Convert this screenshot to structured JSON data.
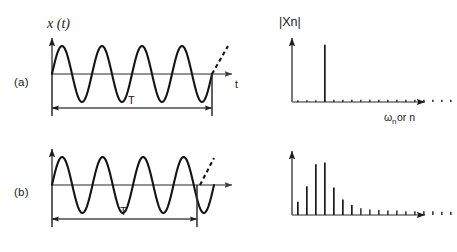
{
  "figure": {
    "title": "",
    "background_color": "#ffffff",
    "ink_color": "#141414",
    "axis_color": "#6f6f6f",
    "width": 457,
    "height": 252
  },
  "labels": {
    "panel_a": "(a)",
    "panel_b": "(b)",
    "time_axis_signal": "x (t)",
    "time_axis_name": "t",
    "period_marker": "T",
    "spectrum_axis_magnitude": "|Xn|",
    "spectrum_axis_freq_omega": "ω",
    "spectrum_axis_freq_sub": "n",
    "spectrum_axis_freq_tail": "or n"
  },
  "chart_data": [
    {
      "id": "panel-a-time-domain",
      "type": "line",
      "panel": "(a)",
      "title": "",
      "xlabel": "t",
      "ylabel": "x (t)",
      "description": "Pure sinusoid, four complete cycles within the record length T",
      "waveform": "sine",
      "cycles": 4,
      "amplitude": 1.0,
      "phase_deg": 0,
      "period_label": "T",
      "period_spans_full_record": true,
      "continuation_dashed": true,
      "axis": {
        "x_origin_px": 52,
        "x_end_px": 240,
        "baseline_y_px": 74,
        "top_y_px": 28,
        "amplitude_px": 28
      }
    },
    {
      "id": "panel-a-spectrum",
      "type": "bar",
      "panel": "(a)",
      "title": "",
      "xlabel": "ωn or n",
      "ylabel": "|Xn|",
      "description": "Line spectrum of the sinusoid: a single dominant harmonic line with negligible leakage",
      "categories": [
        1,
        2,
        3,
        4,
        5,
        6,
        7,
        8,
        9,
        10,
        11,
        12,
        13,
        14,
        15,
        16,
        17,
        18
      ],
      "values": [
        0.03,
        0.03,
        0.03,
        1.0,
        0.04,
        0.04,
        0.04,
        0.04,
        0.04,
        0.04,
        0.04,
        0.04,
        0.04,
        0.04,
        0.04,
        0.04,
        0.04,
        0.04
      ],
      "dominant_index": 4,
      "ylim": [
        0,
        1.05
      ],
      "grid": false,
      "legend": "none",
      "axis": {
        "x_origin_px": 292,
        "x_end_px": 432,
        "baseline_y_px": 102,
        "top_y_px": 34,
        "full_height_px": 60,
        "bar_pitch_px": 9.0
      }
    },
    {
      "id": "panel-b-time-domain",
      "type": "line",
      "panel": "(b)",
      "title": "",
      "xlabel": "t",
      "ylabel": "x (t)",
      "description": "Same sinusoid but the record length T truncates the waveform at a non-integer number of cycles",
      "waveform": "sine",
      "cycles": 4,
      "amplitude": 1.0,
      "phase_deg": 0,
      "period_label": "T",
      "period_spans_full_record": false,
      "period_fraction_of_record": 0.78,
      "continuation_dashed": true,
      "axis": {
        "x_origin_px": 52,
        "x_end_px": 240,
        "baseline_y_px": 185,
        "top_y_px": 140,
        "amplitude_px": 28
      }
    },
    {
      "id": "panel-b-spectrum",
      "type": "bar",
      "panel": "(b)",
      "title": "",
      "xlabel": "ωn or n",
      "ylabel": "|Xn|",
      "description": "Line spectrum with leakage: energy smeared across many harmonics with decaying amplitude",
      "categories": [
        1,
        2,
        3,
        4,
        5,
        6,
        7,
        8,
        9,
        10,
        11,
        12,
        13,
        14,
        15,
        16,
        17,
        18
      ],
      "values": [
        0.24,
        0.52,
        0.92,
        0.95,
        0.5,
        0.28,
        0.18,
        0.12,
        0.1,
        0.09,
        0.08,
        0.08,
        0.07,
        0.07,
        0.07,
        0.07,
        0.06,
        0.06
      ],
      "dominant_index": 4,
      "ylim": [
        0,
        1.05
      ],
      "grid": false,
      "legend": "none",
      "axis": {
        "x_origin_px": 292,
        "x_end_px": 432,
        "baseline_y_px": 215,
        "top_y_px": 150,
        "full_height_px": 58,
        "bar_pitch_px": 9.0
      }
    }
  ]
}
